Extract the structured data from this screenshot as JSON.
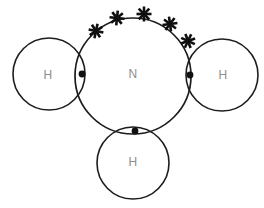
{
  "diagram": {
    "molecule": "NH3",
    "background_color": "#ffffff",
    "stroke_color": "#1c1c1c",
    "label_color": "#8d8d8d",
    "electron_color": "#101010",
    "atoms": [
      {
        "id": "hydrogen-left",
        "label": "H",
        "cx": 49,
        "cy": 74,
        "r": 36,
        "label_x": 48,
        "label_y": 75
      },
      {
        "id": "nitrogen-center",
        "label": "N",
        "cx": 133,
        "cy": 76,
        "r": 58,
        "label_x": 133,
        "label_y": 74
      },
      {
        "id": "hydrogen-right",
        "label": "H",
        "cx": 222,
        "cy": 75,
        "r": 36,
        "label_x": 223,
        "label_y": 75
      },
      {
        "id": "hydrogen-bottom",
        "label": "H",
        "cx": 133,
        "cy": 163,
        "r": 36,
        "label_x": 133,
        "label_y": 162
      }
    ],
    "bonding_electron_dots": [
      {
        "id": "bond-dot-left",
        "cx": 82,
        "cy": 74,
        "r": 3.4
      },
      {
        "id": "bond-dot-right",
        "cx": 190,
        "cy": 75,
        "r": 3.4
      },
      {
        "id": "bond-dot-bottom",
        "cx": 135,
        "cy": 131,
        "r": 3.4
      }
    ],
    "lone_pair_crosses": [
      {
        "id": "cross-1",
        "cx": 96,
        "cy": 31,
        "size": 7.5,
        "rotation": 12
      },
      {
        "id": "cross-2",
        "cx": 117,
        "cy": 18,
        "size": 7.5,
        "rotation": 6
      },
      {
        "id": "cross-3",
        "cx": 144,
        "cy": 14,
        "size": 7.5,
        "rotation": 0
      },
      {
        "id": "cross-4",
        "cx": 170,
        "cy": 24,
        "size": 7.5,
        "rotation": -8
      },
      {
        "id": "cross-5",
        "cx": 188,
        "cy": 41,
        "size": 7.5,
        "rotation": -20
      }
    ]
  }
}
